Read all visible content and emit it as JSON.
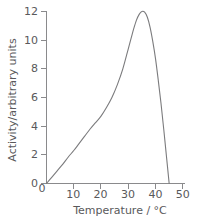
{
  "chart_data": {
    "type": "line",
    "title": "",
    "xlabel": "Temperature / °C",
    "ylabel": "Activity/arbitrary units",
    "xlim": [
      0,
      50
    ],
    "ylim": [
      0,
      12
    ],
    "xticks": [
      0,
      10,
      20,
      30,
      40,
      50
    ],
    "xtick_labels": [
      "0",
      "10",
      "20",
      "30",
      "40",
      "50"
    ],
    "yticks": [
      0,
      2,
      4,
      6,
      8,
      10,
      12
    ],
    "ytick_labels": [
      "0",
      "2",
      "4",
      "6",
      "8",
      "10",
      "12"
    ],
    "grid": false,
    "legend": false,
    "legend_position": "none",
    "series": [
      {
        "name": "Activity",
        "x": [
          0,
          2,
          4,
          6,
          8,
          10,
          12,
          14,
          16,
          18,
          20,
          22,
          24,
          26,
          28,
          30,
          31,
          32,
          33,
          34,
          35,
          36,
          37,
          38,
          39,
          40,
          41,
          42,
          43,
          44,
          45
        ],
        "y": [
          0,
          0.45,
          0.9,
          1.35,
          1.85,
          2.3,
          2.8,
          3.3,
          3.8,
          4.25,
          4.7,
          5.3,
          6.0,
          6.9,
          8.0,
          9.4,
          10.1,
          10.8,
          11.4,
          11.8,
          12.0,
          11.95,
          11.6,
          10.9,
          9.9,
          8.7,
          7.2,
          5.6,
          3.8,
          1.9,
          0.0
        ]
      }
    ],
    "annotations": {
      "peak_value": 12.0,
      "peak_temperature": 35,
      "zero_crossing_temperature": 45
    }
  },
  "axis": {
    "x_label": "Temperature / °C",
    "y_label": "Activity/arbitrary units"
  }
}
